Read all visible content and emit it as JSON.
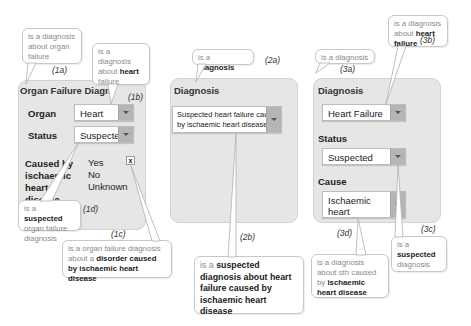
{
  "panel1": {
    "title": "Organ Failure Diagnosis",
    "title_visible": "Organ Failure Diagn",
    "title_tail": "s",
    "organ_label": "Organ",
    "organ_value": "Heart",
    "status_label": "Status",
    "status_value": "Suspected",
    "cause_label_lines": [
      "Caused by",
      "ischaemic",
      "heart",
      "disease"
    ],
    "cause_options": [
      "Yes",
      "No",
      "Unknown"
    ],
    "clear_label": "x",
    "callouts": {
      "a": {
        "pre": "is a diagnosis about organ failure",
        "tag": "(1a)"
      },
      "b": {
        "pre": "is a diagnosis about ",
        "bold": "heart",
        "post": " failure",
        "tag": "(1b)"
      },
      "c": {
        "pre": "is a organ failure diagnosis about a ",
        "bold": "disorder caused by ischaemic heart disease",
        "tag": "(1c)"
      },
      "d": {
        "pre": "is a ",
        "bold": "suspected",
        "post": " organ failure diagnosis",
        "tag": "(1d)"
      }
    }
  },
  "panel2": {
    "title": "Diagnosis",
    "diagnosis_value_line1": "Suspected heart failure caused",
    "diagnosis_value_line2": "by ischaemic heart disease",
    "callouts": {
      "a": {
        "pre": "is a ",
        "bold": "diagnosis",
        "tag": "(2a)"
      },
      "b": {
        "pre": "is a ",
        "bold": "suspected diagnosis about heart failure caused by ischaemic heart disease",
        "tag": "(2b)"
      }
    }
  },
  "panel3": {
    "title": "Diagnosis",
    "diagnosis_value": "Heart Failure",
    "status_label": "Status",
    "status_value": "Suspected",
    "cause_label": "Cause",
    "cause_value_line1": "Ischaemic heart",
    "cause_value_line2": "disease",
    "callouts": {
      "a": {
        "pre": "is a diagnosis",
        "tag": "(3a)"
      },
      "b": {
        "pre": "is a diagnosis about ",
        "bold": "heart failure",
        "tag": "(3b)"
      },
      "c": {
        "pre": "is a ",
        "bold": "suspected",
        "post": " diagnosis",
        "tag": "(3c)"
      },
      "d": {
        "pre": "is a diagnosis about sth caused by ",
        "bold": "ischaemic heart disease",
        "tag": "(3d)"
      }
    }
  },
  "colors": {
    "panel_bg": "#e6e6e6",
    "callout_text": "#8a8a8a",
    "emphasis_text": "#222222",
    "dropdown_arrow_bg": "#b5b5b5"
  }
}
